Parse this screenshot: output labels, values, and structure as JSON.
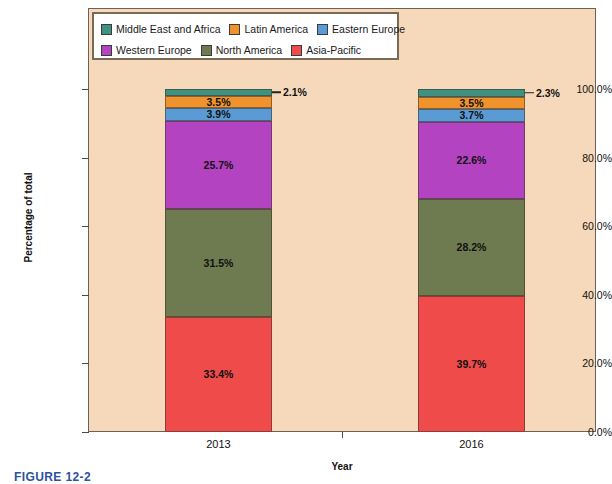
{
  "chart_data": {
    "type": "bar",
    "subtype": "100% stacked column",
    "title": "",
    "xlabel": "Year",
    "ylabel": "Percentage of total",
    "categories": [
      "2013",
      "2016"
    ],
    "ylim": [
      0,
      100
    ],
    "ytick_labels": [
      "0.0%",
      "20.0%",
      "40.0%",
      "60.0%",
      "80.0%",
      "100.0%"
    ],
    "ytick_values": [
      0,
      20,
      40,
      60,
      80,
      100
    ],
    "grid": false,
    "legend_position": "top-left inside plot area",
    "series": [
      {
        "name": "Middle East and Africa",
        "color": "#3f9182",
        "values": [
          2.1,
          2.3
        ],
        "labels": [
          "2.1%",
          "2.3%"
        ],
        "label_placement": "outside"
      },
      {
        "name": "Latin America",
        "color": "#f0932d",
        "values": [
          3.5,
          3.5
        ],
        "labels": [
          "3.5%",
          "3.5%"
        ],
        "label_placement": "inside"
      },
      {
        "name": "Eastern Europe",
        "color": "#5b9bd5",
        "values": [
          3.9,
          3.7
        ],
        "labels": [
          "3.9%",
          "3.7%"
        ],
        "label_placement": "inside"
      },
      {
        "name": "Western Europe",
        "color": "#b343c0",
        "values": [
          25.7,
          22.6
        ],
        "labels": [
          "25.7%",
          "22.6%"
        ],
        "label_placement": "inside"
      },
      {
        "name": "North America",
        "color": "#6e7a4f",
        "values": [
          31.5,
          28.2
        ],
        "labels": [
          "31.5%",
          "28.2%"
        ],
        "label_placement": "inside"
      },
      {
        "name": "Asia-Pacific",
        "color": "#ef4b4b",
        "values": [
          33.4,
          39.7
        ],
        "labels": [
          "33.4%",
          "39.7%"
        ],
        "label_placement": "inside"
      }
    ]
  },
  "legend": {
    "row1": [
      {
        "label": "Middle East and Africa",
        "color": "#3f9182"
      },
      {
        "label": "Latin America",
        "color": "#f0932d"
      },
      {
        "label": "Eastern Europe",
        "color": "#5b9bd5"
      }
    ],
    "row2": [
      {
        "label": "Western Europe",
        "color": "#b343c0"
      },
      {
        "label": "North America",
        "color": "#6e7a4f"
      },
      {
        "label": "Asia-Pacific",
        "color": "#ef4b4b"
      }
    ]
  },
  "caption": "FIGURE 12-2",
  "colors": {
    "plot_background": "#f6d9bb",
    "page_background": "#ffffff",
    "frame_border": "#6b6257",
    "caption_color": "#2d52a0"
  }
}
